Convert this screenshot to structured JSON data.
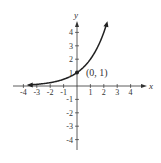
{
  "chart_data": {
    "type": "line",
    "title": "",
    "function": "y = 2^x",
    "xlabel": "x",
    "ylabel": "y",
    "xlim": [
      -4.5,
      4.5
    ],
    "ylim": [
      -4.5,
      4.8
    ],
    "x_ticks": [
      "-4",
      "-3",
      "-2",
      "-1",
      "1",
      "2",
      "3",
      "4"
    ],
    "y_ticks": [
      "4",
      "3",
      "2",
      "1",
      "-1",
      "-2",
      "-3",
      "-4"
    ],
    "grid": false,
    "series": [
      {
        "name": "y = 2^x",
        "x": [
          -3.7,
          -3,
          -2,
          -1,
          0,
          1,
          2,
          2.2
        ],
        "y": [
          0.08,
          0.125,
          0.25,
          0.5,
          1,
          2,
          4,
          4.6
        ]
      }
    ],
    "annotations": [
      {
        "x": 0,
        "y": 1,
        "label": "(0, 1)"
      }
    ]
  }
}
